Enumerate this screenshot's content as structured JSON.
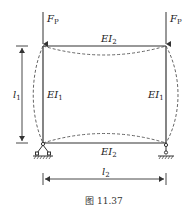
{
  "figure": {
    "caption": "图 11.37",
    "frame": {
      "top_beam_label": "EI",
      "top_beam_sub": "2",
      "bottom_beam_label": "EI",
      "bottom_beam_sub": "2",
      "left_column_label": "EI",
      "left_column_sub": "1",
      "right_column_label": "EI",
      "right_column_sub": "1"
    },
    "loads": {
      "left_load_label": "F",
      "left_load_sub": "P",
      "right_load_label": "F",
      "right_load_sub": "P"
    },
    "dimensions": {
      "height_label": "l",
      "height_sub": "1",
      "width_label": "l",
      "width_sub": "2"
    },
    "supports": {
      "left": "pin-support",
      "right": "roller-support"
    },
    "colors": {
      "line": "#333333",
      "dashed": "#555555"
    }
  }
}
